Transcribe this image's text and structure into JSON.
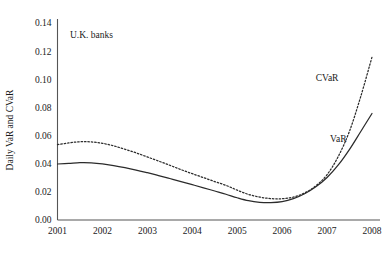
{
  "chart_data": {
    "type": "line",
    "title": "",
    "annotation": "U.K. banks",
    "xlabel": "",
    "ylabel": "Daily VaR and CVaR",
    "x": [
      2001,
      2002,
      2003,
      2004,
      2005,
      2006,
      2007,
      2008
    ],
    "xtick_labels": [
      "2001",
      "2002",
      "2003",
      "2004",
      "2005",
      "2006",
      "2007",
      "2008"
    ],
    "ytick_labels": [
      "0.00",
      "0.02",
      "0.04",
      "0.06",
      "0.08",
      "0.10",
      "0.12",
      "0.14"
    ],
    "ytick_values": [
      0.0,
      0.02,
      0.04,
      0.06,
      0.08,
      0.1,
      0.12,
      0.14
    ],
    "xlim": [
      2001,
      2008
    ],
    "ylim": [
      0.0,
      0.14
    ],
    "grid": false,
    "legend_position": "inline-annotation",
    "series": [
      {
        "name": "CVaR",
        "style": "dotted",
        "color": "#2b2b2b",
        "label_x": 2007.0,
        "label_y": 0.0985,
        "points": [
          {
            "x": 2001.0,
            "y": 0.0535
          },
          {
            "x": 2001.25,
            "y": 0.0548
          },
          {
            "x": 2001.5,
            "y": 0.0556
          },
          {
            "x": 2001.75,
            "y": 0.0555
          },
          {
            "x": 2002.0,
            "y": 0.0545
          },
          {
            "x": 2002.25,
            "y": 0.0527
          },
          {
            "x": 2002.5,
            "y": 0.0503
          },
          {
            "x": 2002.75,
            "y": 0.0477
          },
          {
            "x": 2003.0,
            "y": 0.0448
          },
          {
            "x": 2003.25,
            "y": 0.0419
          },
          {
            "x": 2003.5,
            "y": 0.0389
          },
          {
            "x": 2003.75,
            "y": 0.0358
          },
          {
            "x": 2004.0,
            "y": 0.0329
          },
          {
            "x": 2004.25,
            "y": 0.0301
          },
          {
            "x": 2004.5,
            "y": 0.0273
          },
          {
            "x": 2004.75,
            "y": 0.0246
          },
          {
            "x": 2005.0,
            "y": 0.0212
          },
          {
            "x": 2005.25,
            "y": 0.0182
          },
          {
            "x": 2005.5,
            "y": 0.0163
          },
          {
            "x": 2005.75,
            "y": 0.0152
          },
          {
            "x": 2006.0,
            "y": 0.0151
          },
          {
            "x": 2006.25,
            "y": 0.0163
          },
          {
            "x": 2006.5,
            "y": 0.0192
          },
          {
            "x": 2006.75,
            "y": 0.0243
          },
          {
            "x": 2007.0,
            "y": 0.0322
          },
          {
            "x": 2007.25,
            "y": 0.0452
          },
          {
            "x": 2007.5,
            "y": 0.0632
          },
          {
            "x": 2007.75,
            "y": 0.0878
          },
          {
            "x": 2008.0,
            "y": 0.1158
          }
        ]
      },
      {
        "name": "VaR",
        "style": "solid",
        "color": "#2b2b2b",
        "label_x": 2007.25,
        "label_y": 0.0555,
        "points": [
          {
            "x": 2001.0,
            "y": 0.0398
          },
          {
            "x": 2001.25,
            "y": 0.0402
          },
          {
            "x": 2001.5,
            "y": 0.0407
          },
          {
            "x": 2001.75,
            "y": 0.0406
          },
          {
            "x": 2002.0,
            "y": 0.0399
          },
          {
            "x": 2002.25,
            "y": 0.0387
          },
          {
            "x": 2002.5,
            "y": 0.0372
          },
          {
            "x": 2002.75,
            "y": 0.0355
          },
          {
            "x": 2003.0,
            "y": 0.0336
          },
          {
            "x": 2003.25,
            "y": 0.0316
          },
          {
            "x": 2003.5,
            "y": 0.0295
          },
          {
            "x": 2003.75,
            "y": 0.0273
          },
          {
            "x": 2004.0,
            "y": 0.0251
          },
          {
            "x": 2004.25,
            "y": 0.0229
          },
          {
            "x": 2004.5,
            "y": 0.0206
          },
          {
            "x": 2004.75,
            "y": 0.0183
          },
          {
            "x": 2005.0,
            "y": 0.0158
          },
          {
            "x": 2005.25,
            "y": 0.0137
          },
          {
            "x": 2005.5,
            "y": 0.0126
          },
          {
            "x": 2005.75,
            "y": 0.0124
          },
          {
            "x": 2006.0,
            "y": 0.0131
          },
          {
            "x": 2006.25,
            "y": 0.0152
          },
          {
            "x": 2006.5,
            "y": 0.0187
          },
          {
            "x": 2006.75,
            "y": 0.0236
          },
          {
            "x": 2007.0,
            "y": 0.0302
          },
          {
            "x": 2007.25,
            "y": 0.0391
          },
          {
            "x": 2007.5,
            "y": 0.0502
          },
          {
            "x": 2007.75,
            "y": 0.0629
          },
          {
            "x": 2008.0,
            "y": 0.0757
          }
        ]
      }
    ]
  },
  "axes": {
    "ylabel": "Daily VaR and CVaR",
    "annotation": "U.K. banks"
  }
}
